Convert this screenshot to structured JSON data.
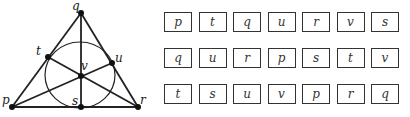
{
  "diagram": {
    "points": [
      {
        "label": "q",
        "x": 81,
        "y": 13
      },
      {
        "label": "p",
        "x": 12,
        "y": 107
      },
      {
        "label": "r",
        "x": 138,
        "y": 107
      },
      {
        "label": "t",
        "x": 48,
        "y": 57
      },
      {
        "label": "u",
        "x": 112,
        "y": 63
      },
      {
        "label": "v",
        "x": 81,
        "y": 76
      },
      {
        "label": "s",
        "x": 81,
        "y": 107
      }
    ]
  },
  "grid": {
    "rows": [
      [
        "p",
        "t",
        "q",
        "u",
        "r",
        "v",
        "s"
      ],
      [
        "q",
        "u",
        "r",
        "p",
        "s",
        "t",
        "v"
      ],
      [
        "t",
        "s",
        "u",
        "v",
        "p",
        "r",
        "q"
      ]
    ]
  }
}
